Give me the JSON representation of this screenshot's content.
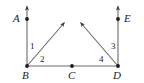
{
  "figure": {
    "type": "geometry-diagram",
    "stroke_color": "#555555",
    "point_color": "#1a1a1a",
    "text_color": "#1a1a1a",
    "background_color": "#ffffff",
    "width": 144,
    "height": 83
  },
  "points": [
    {
      "id": "A",
      "label": "A",
      "x": 27,
      "y": 19,
      "label_x": 13,
      "label_y": 14
    },
    {
      "id": "B",
      "label": "B",
      "x": 27,
      "y": 66,
      "label_x": 22,
      "label_y": 70
    },
    {
      "id": "C",
      "label": "C",
      "x": 72,
      "y": 66,
      "label_x": 68,
      "label_y": 70
    },
    {
      "id": "D",
      "label": "D",
      "x": 118,
      "y": 66,
      "label_x": 113,
      "label_y": 70
    },
    {
      "id": "E",
      "label": "E",
      "x": 118,
      "y": 19,
      "label_x": 124,
      "label_y": 14
    }
  ],
  "rays": [
    {
      "id": "ray-BA",
      "from": "B",
      "through": "A",
      "x1": 27,
      "y1": 66,
      "x2": 27,
      "y2": 5
    },
    {
      "id": "ray-DE",
      "from": "D",
      "through": "E",
      "x1": 118,
      "y1": 66,
      "x2": 118,
      "y2": 5
    },
    {
      "id": "ray-B-up-right",
      "from": "B",
      "x1": 27,
      "y1": 66,
      "x2": 65,
      "y2": 21
    },
    {
      "id": "ray-D-up-left",
      "from": "D",
      "x1": 118,
      "y1": 66,
      "x2": 79,
      "y2": 21
    }
  ],
  "segments": [
    {
      "id": "segment-BD",
      "from": "B",
      "to": "D",
      "x1": 27,
      "y1": 66,
      "x2": 118,
      "y2": 66
    }
  ],
  "angles": [
    {
      "id": "angle-1",
      "label": "1",
      "x": 30,
      "y": 42,
      "vertex": "B"
    },
    {
      "id": "angle-2",
      "label": "2",
      "x": 40,
      "y": 55,
      "vertex": "B"
    },
    {
      "id": "angle-3",
      "label": "3",
      "x": 111,
      "y": 42,
      "vertex": "D"
    },
    {
      "id": "angle-4",
      "label": "4",
      "x": 99,
      "y": 55,
      "vertex": "D"
    }
  ]
}
